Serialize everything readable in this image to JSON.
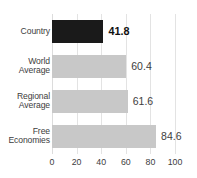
{
  "chart_data": {
    "type": "bar",
    "orientation": "horizontal",
    "title": "",
    "xlabel": "",
    "ylabel": "",
    "categories": [
      "Country",
      "World Average",
      "Regional Average",
      "Free Economies"
    ],
    "values": [
      41.8,
      60.4,
      61.6,
      84.6
    ],
    "value_labels": [
      "41.8",
      "60.4",
      "61.6",
      "84.6"
    ],
    "xlim": [
      0,
      100
    ],
    "xticks": [
      0,
      20,
      40,
      60,
      80,
      100
    ],
    "xtick_labels": [
      "0",
      "20",
      "40",
      "60",
      "80",
      "100"
    ],
    "grid": true,
    "grid_axis": "x",
    "legend": false,
    "bars": [
      {
        "category": "Country",
        "category_lines": [
          "Country"
        ],
        "value": 41.8,
        "value_label": "41.8",
        "color": "#1a1a1a",
        "emphasis": true
      },
      {
        "category": "World Average",
        "category_lines": [
          "World",
          "Average"
        ],
        "value": 60.4,
        "value_label": "60.4",
        "color": "#c8c8c8",
        "emphasis": false
      },
      {
        "category": "Regional Average",
        "category_lines": [
          "Regional",
          "Average"
        ],
        "value": 61.6,
        "value_label": "61.6",
        "color": "#c8c8c8",
        "emphasis": false
      },
      {
        "category": "Free Economies",
        "category_lines": [
          "Free",
          "Economies"
        ],
        "value": 84.6,
        "value_label": "84.6",
        "color": "#c8c8c8",
        "emphasis": false
      }
    ]
  },
  "colors": {
    "highlight_bar": "#1a1a1a",
    "default_bar": "#c8c8c8",
    "gridline": "#e3e3e3",
    "text": "#3d3d3d",
    "background": "#ffffff"
  }
}
